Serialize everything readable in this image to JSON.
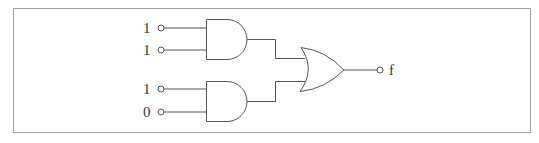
{
  "diagram": {
    "type": "logic-circuit",
    "frame": {
      "stroke": "#a0a0a0"
    },
    "colors": {
      "wire": "#555555",
      "text": "#333333"
    },
    "gates": [
      {
        "id": "and1",
        "type": "AND",
        "inputs": [
          "in1",
          "in2"
        ]
      },
      {
        "id": "and2",
        "type": "AND",
        "inputs": [
          "in3",
          "in4"
        ]
      },
      {
        "id": "or1",
        "type": "OR",
        "inputs": [
          "and1",
          "and2"
        ],
        "output": "f"
      }
    ],
    "inputs": [
      {
        "id": "in1",
        "value": "1"
      },
      {
        "id": "in2",
        "value": "1"
      },
      {
        "id": "in3",
        "value": "1"
      },
      {
        "id": "in4",
        "value": "0"
      }
    ],
    "output": {
      "label": "f"
    }
  }
}
